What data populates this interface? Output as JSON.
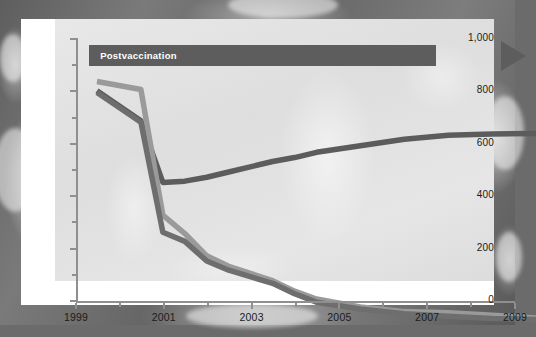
{
  "figure": {
    "background": "ct-scan-grayscale",
    "panel_background": "#ffffff",
    "plot_background": "#e3e3e3"
  },
  "annotation": {
    "label": "Postvaccination",
    "icon": "right-arrow-banner-icon",
    "color": "#5d5d5d",
    "text_color": "#ffffff",
    "start_year": 1999.3,
    "end_year": 2007.2
  },
  "chart_data": {
    "type": "line",
    "title": "",
    "xlabel": "",
    "ylabel": "",
    "xlim": [
      1999,
      2009
    ],
    "ylim": [
      0,
      1000
    ],
    "grid": false,
    "legend": "none",
    "x": [
      1999,
      2000,
      2000.5,
      2001,
      2001.5,
      2002,
      2003,
      2003.5,
      2004,
      2005,
      2006,
      2007,
      2008,
      2009
    ],
    "xticks": [
      1999,
      2000,
      2001,
      2002,
      2003,
      2004,
      2005,
      2006,
      2007,
      2008,
      2009
    ],
    "xtick_labels_major": [
      "1999",
      "2001",
      "2003",
      "2005",
      "2007",
      "2009"
    ],
    "xtick_major_values": [
      1999,
      2001,
      2003,
      2005,
      2007,
      2009
    ],
    "yticks": [
      0,
      100,
      200,
      300,
      400,
      500,
      600,
      700,
      800,
      900,
      1000
    ],
    "ytick_labels_major": [
      "0",
      "200",
      "400",
      "600",
      "800",
      "1,000"
    ],
    "ytick_major_values": [
      0,
      200,
      400,
      600,
      800,
      1000
    ],
    "series": [
      {
        "name": "upper-series",
        "color": "#5c5c5c",
        "width": 5.5,
        "values": [
          875,
          760,
          525,
          530,
          545,
          565,
          605,
          620,
          640,
          665,
          690,
          705,
          710,
          712
        ]
      },
      {
        "name": "middle-series",
        "color": "#9a9a9a",
        "width": 5.5,
        "values": [
          910,
          880,
          400,
          330,
          245,
          205,
          150,
          110,
          80,
          50,
          32,
          28,
          18,
          8
        ]
      },
      {
        "name": "lower-series",
        "color": "#6e6e6e",
        "width": 5.5,
        "values": [
          868,
          755,
          335,
          300,
          225,
          190,
          140,
          100,
          68,
          42,
          24,
          14,
          6,
          2
        ]
      }
    ]
  }
}
